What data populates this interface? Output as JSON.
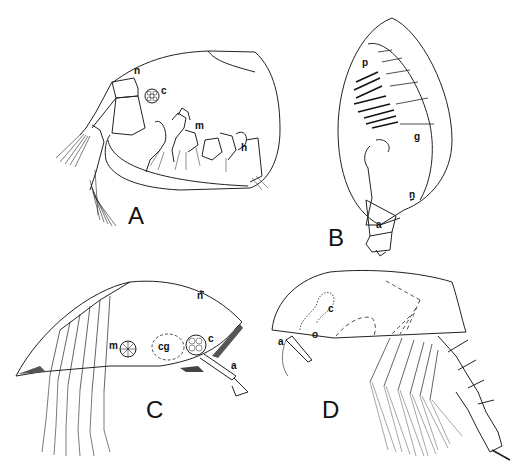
{
  "figure": {
    "panels": [
      {
        "id": "A",
        "label": "A",
        "parts": [
          {
            "key": "n",
            "label": "n"
          },
          {
            "key": "c",
            "label": "c"
          },
          {
            "key": "m",
            "label": "m"
          },
          {
            "key": "h",
            "label": "h"
          }
        ]
      },
      {
        "id": "B",
        "label": "B",
        "parts": [
          {
            "key": "p",
            "label": "p"
          },
          {
            "key": "g",
            "label": "g"
          },
          {
            "key": "n",
            "label": "n"
          },
          {
            "key": "a",
            "label": "a"
          }
        ]
      },
      {
        "id": "C",
        "label": "C",
        "parts": [
          {
            "key": "n",
            "label": "n"
          },
          {
            "key": "m",
            "label": "m"
          },
          {
            "key": "cg",
            "label": "cg"
          },
          {
            "key": "c",
            "label": "c"
          },
          {
            "key": "a",
            "label": "a"
          }
        ]
      },
      {
        "id": "D",
        "label": "D",
        "parts": [
          {
            "key": "c",
            "label": "c"
          },
          {
            "key": "a",
            "label": "a"
          },
          {
            "key": "o",
            "label": "o"
          }
        ]
      }
    ]
  }
}
